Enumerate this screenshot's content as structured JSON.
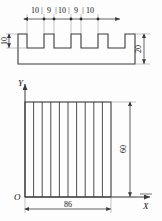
{
  "figure": {
    "title": "",
    "top_view": {
      "name": "castellated-profile",
      "dimension_chain": [
        "10",
        "9",
        "10",
        "9",
        "10"
      ],
      "left_dimension": "10",
      "right_dimension": "20"
    },
    "bottom_view": {
      "name": "hatched-rectangle-on-axes",
      "axis_y_label": "Y",
      "axis_x_label": "X",
      "origin_label": "O",
      "height_dimension": "60",
      "width_dimension": "86",
      "hatch_line_count": 10
    },
    "colors": {
      "line": "#3a3a3a",
      "thin": "#7a7a7a",
      "background": "#fdfdfd"
    }
  }
}
